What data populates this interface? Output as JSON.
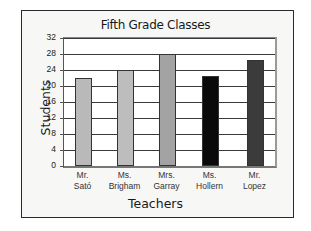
{
  "chart_data": {
    "type": "bar",
    "title": "Fifth Grade Classes",
    "xlabel": "Teachers",
    "ylabel": "Students",
    "categories": [
      {
        "line1": "Mr.",
        "line2": "Sató"
      },
      {
        "line1": "Ms.",
        "line2": "Brigham"
      },
      {
        "line1": "Mrs.",
        "line2": "Garray"
      },
      {
        "line1": "Ms.",
        "line2": "Hollern"
      },
      {
        "line1": "Mr.",
        "line2": "Lopez"
      }
    ],
    "category_names": [
      "Mr. Sató",
      "Ms. Brigham",
      "Mrs. Garray",
      "Ms. Hollern",
      "Mr. Lopez"
    ],
    "values": [
      22,
      24,
      28,
      22.5,
      26.5
    ],
    "bar_colors": [
      "#b9b9b9",
      "#bdbdbd",
      "#a3a3a3",
      "#0a0a0a",
      "#3b3b3b"
    ],
    "ylim": [
      0,
      32
    ],
    "yticks": [
      0,
      4,
      8,
      12,
      16,
      20,
      24,
      28,
      32
    ],
    "grid": true,
    "legend": null
  }
}
